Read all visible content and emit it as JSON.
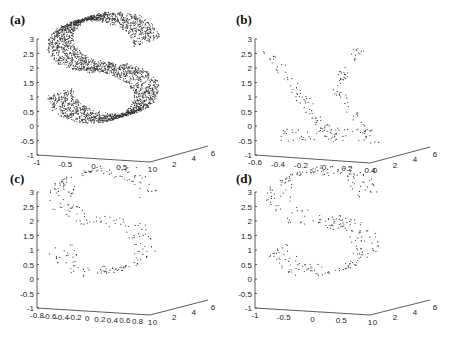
{
  "figure": {
    "panels": [
      "(a)",
      "(b)",
      "(c)",
      "(d)"
    ]
  },
  "chart_data": [
    {
      "type": "scatter",
      "panel": "(a)",
      "title": "",
      "description": "Dense S-curve point cloud (several thousand points)",
      "x_ticks": [
        "-1",
        "-0.5",
        "0",
        "0.5",
        "1"
      ],
      "y_ticks": [
        "-1",
        "-0.5",
        "0",
        "0.5",
        "1",
        "1.5",
        "2",
        "2.5",
        "3"
      ],
      "z_ticks": [
        "0",
        "2",
        "4",
        "6"
      ],
      "xlim": [
        -1,
        1
      ],
      "ylim": [
        -1,
        3
      ],
      "zlim": [
        0,
        6
      ],
      "point_count_approx": 3000,
      "shape": "S"
    },
    {
      "type": "scatter",
      "panel": "(b)",
      "description": "Sparse points forming two diagonal strands (X/Y-like shape)",
      "x_ticks": [
        "-0.6",
        "-0.4",
        "-0.2",
        "0",
        "0.2",
        "0.4"
      ],
      "y_ticks": [
        "-1",
        "-0.5",
        "0",
        "0.5",
        "1",
        "1.5",
        "2",
        "2.5",
        "3"
      ],
      "z_ticks": [
        "0",
        "2",
        "4",
        "6"
      ],
      "xlim": [
        -0.6,
        0.4
      ],
      "ylim": [
        -1,
        3
      ],
      "zlim": [
        0,
        6
      ],
      "point_count_approx": 200,
      "shape": "two-strands"
    },
    {
      "type": "scatter",
      "panel": "(c)",
      "description": "Sparse S-curve samples",
      "x_ticks": [
        "-0.8",
        "-0.6",
        "-0.4",
        "-0.2",
        "0",
        "0.2",
        "0.4",
        "0.6",
        "0.8",
        "1"
      ],
      "y_ticks": [
        "-1",
        "-0.5",
        "0",
        "0.5",
        "1",
        "1.5",
        "2",
        "2.5",
        "3"
      ],
      "z_ticks": [
        "0",
        "2",
        "4",
        "6"
      ],
      "xlim": [
        -0.8,
        1
      ],
      "ylim": [
        -1,
        3
      ],
      "zlim": [
        0,
        6
      ],
      "point_count_approx": 250,
      "shape": "S"
    },
    {
      "type": "scatter",
      "panel": "(d)",
      "description": "Sparse S-curve samples",
      "x_ticks": [
        "-1",
        "-0.5",
        "0",
        "0.5",
        "1"
      ],
      "y_ticks": [
        "-1",
        "-0.5",
        "0",
        "0.5",
        "1",
        "1.5",
        "2",
        "2.5",
        "3"
      ],
      "z_ticks": [
        "0",
        "2",
        "4",
        "6"
      ],
      "xlim": [
        -1,
        1
      ],
      "ylim": [
        -1,
        3
      ],
      "zlim": [
        0,
        6
      ],
      "point_count_approx": 300,
      "shape": "S"
    }
  ]
}
